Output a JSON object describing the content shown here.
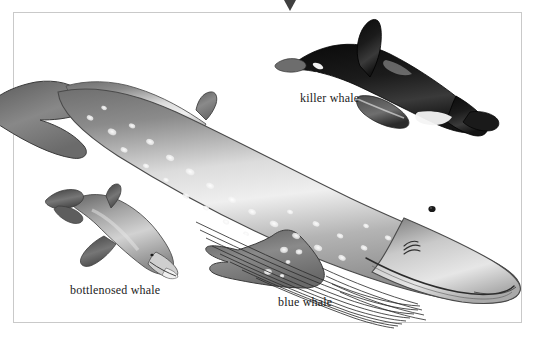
{
  "plate": {
    "kind": "natural-history-illustration",
    "background_color": "#ffffff",
    "frame_color": "#c9c9c9",
    "marker_icon": "triangle-down-marker",
    "marker_color": "#404040",
    "label_color": "#1c1c1c"
  },
  "figures": [
    {
      "id": "blue-whale",
      "label": "blue whale",
      "icon": "blue-whale-illustration",
      "body_color": "#8d8d8d",
      "highlight_color": "#f0f0f0",
      "notes": "largest figure, head lower-right, tail fluke upper-left, mottled light spots, ventral throat grooves"
    },
    {
      "id": "killer-whale",
      "label": "killer whale",
      "icon": "killer-whale-illustration",
      "body_color": "#111111",
      "highlight_color": "#f2f2f2",
      "notes": "upper-right, black with white eye patch and belly, head upper-left, tail lower-right"
    },
    {
      "id": "bottlenosed-whale",
      "label": "bottlenosed whale",
      "icon": "bottlenosed-whale-illustration",
      "body_color": "#8a8a8a",
      "highlight_color": "#e8e8e8",
      "notes": "lower-left, small grey beaked whale, head lower-right, tail upper-left"
    }
  ]
}
